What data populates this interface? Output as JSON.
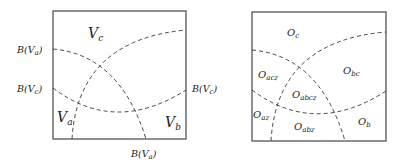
{
  "left_panel": {
    "regions": {
      "vc": "V",
      "vc_sub": "c",
      "va": "V",
      "va_sub": "a",
      "vb": "V",
      "vb_sub": "b"
    },
    "boundary_labels": {
      "left_top": "B(V",
      "left_top_sub": "a",
      "left_mid": "B(V",
      "left_mid_sub": "c",
      "right_mid": "B(V",
      "right_mid_sub": "c",
      "bottom": "B(V",
      "bottom_sub": "a",
      "close": ")"
    }
  },
  "right_panel": {
    "regions": {
      "oc": "O",
      "oc_sub": "c",
      "oacz": "O",
      "oacz_sub": "acz",
      "obc": "O",
      "obc_sub": "bc",
      "oabcz": "O",
      "oabcz_sub": "abcz",
      "oaz": "O",
      "oaz_sub": "az",
      "oabz": "O",
      "oabz_sub": "abz",
      "ob": "O",
      "ob_sub": "b"
    }
  }
}
